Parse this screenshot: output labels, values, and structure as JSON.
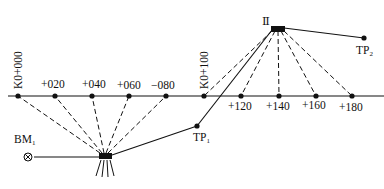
{
  "diagram": {
    "type": "leveling-profile-survey",
    "baseline_y": 96,
    "stations": [
      {
        "id": "K0+000",
        "label": "K0+000",
        "x": 18,
        "vertical": true,
        "label_above": true
      },
      {
        "id": "+020",
        "label": "+020",
        "x": 55,
        "label_above": true
      },
      {
        "id": "+040",
        "label": "+040",
        "x": 92,
        "label_above": true
      },
      {
        "id": "+060",
        "label": "+060",
        "x": 129,
        "label_above": true
      },
      {
        "id": "-080",
        "label": "−080",
        "x": 166,
        "label_above": true
      },
      {
        "id": "K0+100",
        "label": "K0+100",
        "x": 204,
        "vertical": true,
        "label_above": true
      },
      {
        "id": "+120",
        "label": "+120",
        "x": 241,
        "label_above": false
      },
      {
        "id": "+140",
        "label": "+140",
        "x": 279,
        "label_above": false
      },
      {
        "id": "+160",
        "label": "+160",
        "x": 316,
        "label_above": false
      },
      {
        "id": "+180",
        "label": "+180",
        "x": 352,
        "label_above": false
      }
    ],
    "instrument_stations": [
      {
        "id": "I",
        "x": 105,
        "y": 156,
        "label": ""
      },
      {
        "id": "II",
        "x": 278,
        "y": 28,
        "label": "Ⅱ"
      }
    ],
    "benchmark": {
      "label": "BM",
      "subscript": "1",
      "x": 28,
      "y": 157
    },
    "turning_points": [
      {
        "label": "TP",
        "subscript": "1",
        "x": 197,
        "y": 126
      },
      {
        "label": "TP",
        "subscript": "2",
        "x": 364,
        "y": 38
      }
    ]
  }
}
